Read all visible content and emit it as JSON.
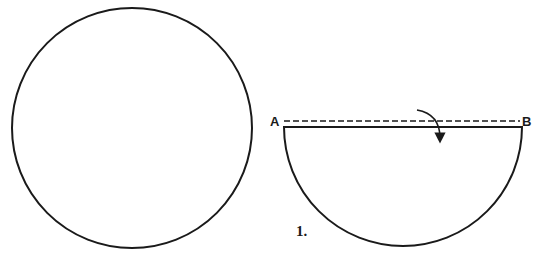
{
  "diagram": {
    "colors": {
      "stroke": "#1a1a1a",
      "background": "#ffffff"
    },
    "left_figure": {
      "shape": "circle",
      "center": [
        132,
        128
      ],
      "radius": 120
    },
    "right_figure": {
      "shape": "semicircle",
      "center": [
        403,
        127
      ],
      "radius": 119,
      "fold_line": {
        "style": "dashed",
        "y": 121,
        "from_x": 284,
        "to_x": 520
      },
      "point_labels": {
        "a": "A",
        "b": "B"
      },
      "arrow": "curved-fold-arrow",
      "step_label": "1."
    }
  }
}
